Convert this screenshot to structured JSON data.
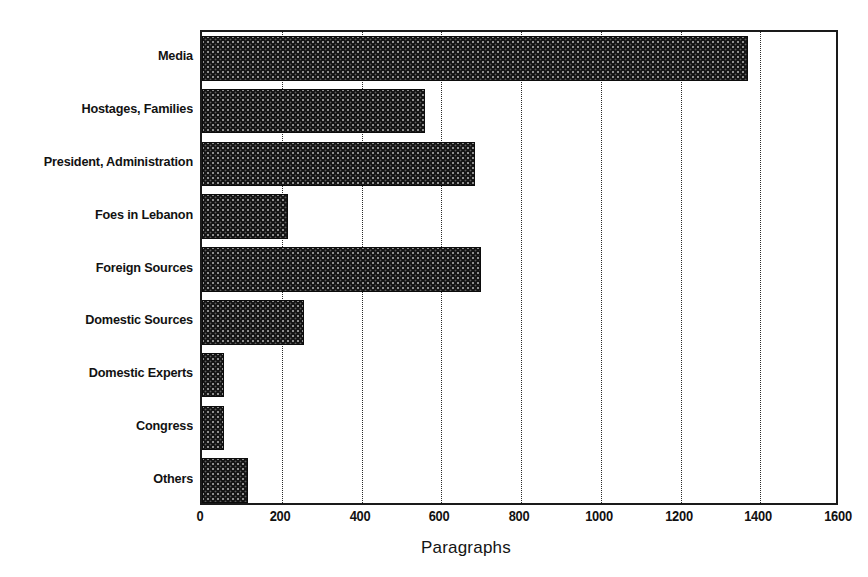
{
  "chart_data": {
    "type": "bar",
    "orientation": "horizontal",
    "title": "",
    "xlabel": "Paragraphs",
    "ylabel": "",
    "xlim": [
      0,
      1600
    ],
    "xticks": [
      0,
      200,
      400,
      600,
      800,
      1000,
      1200,
      1400,
      1600
    ],
    "xtick_labels": [
      "0",
      "200",
      "400",
      "600",
      "800",
      "1000",
      "1200",
      "1400",
      "1600"
    ],
    "grid": "vertical-dotted",
    "legend": "none",
    "categories": [
      "Media",
      "Hostages, Families",
      "President, Administration",
      "Foes in Lebanon",
      "Foreign Sources",
      "Domestic Sources",
      "Domestic Experts",
      "Congress",
      "Others"
    ],
    "values": [
      1370,
      560,
      685,
      215,
      700,
      255,
      55,
      55,
      115
    ],
    "bar_fill_color": "#141414",
    "axis_color": "#1a1a1a",
    "gridline_color": "#2b2b2b",
    "background_color": "#ffffff"
  }
}
